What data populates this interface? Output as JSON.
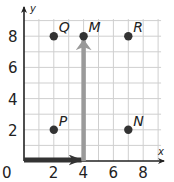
{
  "chart_data": {
    "type": "scatter",
    "title": "",
    "xlabel": "x",
    "ylabel": "y",
    "xlim": [
      0,
      9.5
    ],
    "ylim": [
      0,
      9.5
    ],
    "grid": true,
    "x_ticks": [
      0,
      2,
      4,
      6,
      8
    ],
    "y_ticks": [
      2,
      4,
      6,
      8
    ],
    "tick_labels": {
      "origin": "0",
      "x": [
        "2",
        "4",
        "6",
        "8"
      ],
      "y": [
        "2",
        "4",
        "6",
        "8"
      ]
    },
    "points": [
      {
        "label": "Q",
        "x": 2,
        "y": 8
      },
      {
        "label": "M",
        "x": 4,
        "y": 8
      },
      {
        "label": "R",
        "x": 7,
        "y": 8
      },
      {
        "label": "P",
        "x": 2,
        "y": 2
      },
      {
        "label": "N",
        "x": 7,
        "y": 2
      }
    ],
    "arrows": [
      {
        "name": "horizontal-move",
        "from": [
          0,
          0
        ],
        "to": [
          4,
          0
        ],
        "color": "#333333"
      },
      {
        "name": "vertical-move",
        "from": [
          4,
          0
        ],
        "to": [
          4,
          8
        ],
        "color": "#9a9a9a"
      }
    ]
  },
  "colors": {
    "grid": "#cfcfcf",
    "axis": "#222222",
    "point": "#333333",
    "arrow_dark": "#333333",
    "arrow_gray": "#9a9a9a"
  }
}
